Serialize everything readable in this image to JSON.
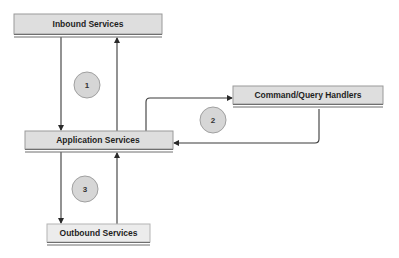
{
  "diagram": {
    "nodes": {
      "inbound": {
        "label": "Inbound Services"
      },
      "application": {
        "label": "Application Services"
      },
      "command_query": {
        "label": "Command/Query Handlers"
      },
      "outbound": {
        "label": "Outbound Services"
      }
    },
    "steps": [
      {
        "label": "1"
      },
      {
        "label": "2"
      },
      {
        "label": "3"
      }
    ],
    "edges": [
      {
        "from": "Inbound Services",
        "to": "Application Services"
      },
      {
        "from": "Application Services",
        "to": "Inbound Services"
      },
      {
        "from": "Application Services",
        "to": "Command/Query Handlers"
      },
      {
        "from": "Command/Query Handlers",
        "to": "Application Services"
      },
      {
        "from": "Application Services",
        "to": "Outbound Services"
      },
      {
        "from": "Outbound Services",
        "to": "Application Services"
      }
    ],
    "colors": {
      "box_fill": "#dedede",
      "step_fill": "#d6d6d6",
      "edge": "#3a3a3a"
    }
  }
}
